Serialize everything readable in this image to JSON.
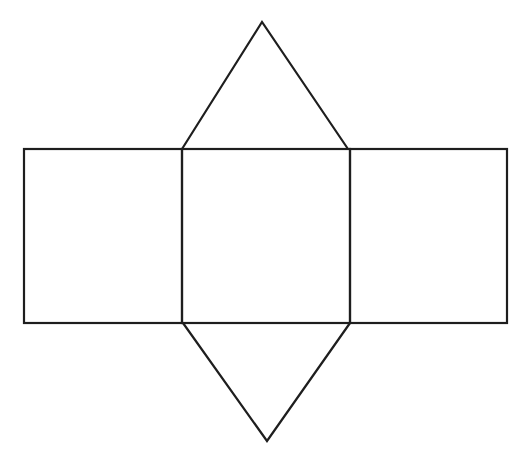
{
  "diagram": {
    "type": "net-of-triangular-prism",
    "stroke_color": "#1e1e1e",
    "background": "#ffffff",
    "faces": [
      {
        "name": "left-rectangle",
        "shape": "rect",
        "points": [
          [
            24,
            149
          ],
          [
            182,
            149
          ],
          [
            182,
            323
          ],
          [
            24,
            323
          ]
        ]
      },
      {
        "name": "center-rectangle",
        "shape": "rect",
        "points": [
          [
            182,
            149
          ],
          [
            350,
            149
          ],
          [
            350,
            323
          ],
          [
            182,
            323
          ]
        ]
      },
      {
        "name": "right-rectangle",
        "shape": "rect",
        "points": [
          [
            350,
            149
          ],
          [
            507,
            149
          ],
          [
            507,
            323
          ],
          [
            350,
            323
          ]
        ]
      },
      {
        "name": "top-triangle",
        "shape": "triangle",
        "points": [
          [
            182,
            149
          ],
          [
            262,
            22
          ],
          [
            348,
            149
          ]
        ]
      },
      {
        "name": "bottom-triangle",
        "shape": "triangle",
        "points": [
          [
            183,
            323
          ],
          [
            267,
            441
          ],
          [
            350,
            323
          ]
        ]
      }
    ]
  }
}
